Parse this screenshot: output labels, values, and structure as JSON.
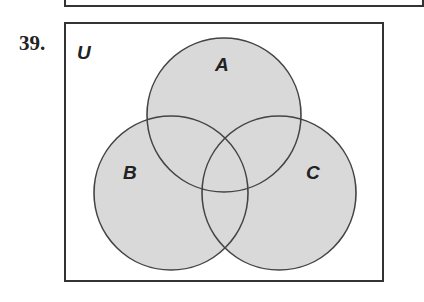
{
  "problem": {
    "number": "39."
  },
  "diagram": {
    "type": "venn",
    "universe_label": "U",
    "sets": [
      {
        "label": "A",
        "shaded": true
      },
      {
        "label": "B",
        "shaded": true
      },
      {
        "label": "C",
        "shaded": true
      }
    ],
    "fill_color": "#d9d9d9",
    "stroke_color": "#444444"
  }
}
